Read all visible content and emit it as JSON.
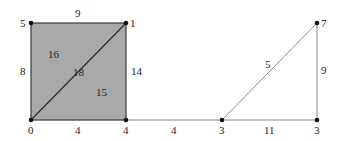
{
  "diagram": {
    "type": "weighted-graph",
    "colors": {
      "face_fill": "#a9a9a9",
      "edge": "#3a3a3a",
      "light_edge": "#8c8c8c",
      "node": "#111111"
    },
    "nodes": [
      {
        "id": "n5",
        "label": "5",
        "x": 31,
        "y": 23
      },
      {
        "id": "n1",
        "label": "1",
        "x": 126,
        "y": 23
      },
      {
        "id": "n0",
        "label": "0",
        "x": 31,
        "y": 120
      },
      {
        "id": "n4",
        "label": "4",
        "x": 126,
        "y": 120
      },
      {
        "id": "n3a",
        "label": "3",
        "x": 222,
        "y": 120
      },
      {
        "id": "n3b",
        "label": "3",
        "x": 317,
        "y": 120
      },
      {
        "id": "n7",
        "label": "7",
        "x": 317,
        "y": 23
      }
    ],
    "edges": [
      {
        "from": "n5",
        "to": "n1",
        "label": "9"
      },
      {
        "from": "n5",
        "to": "n0",
        "label": "8"
      },
      {
        "from": "n1",
        "to": "n4",
        "label": "14"
      },
      {
        "from": "n0",
        "to": "n4",
        "label": "4"
      },
      {
        "from": "n0",
        "to": "n1",
        "label": "18"
      },
      {
        "from": "n4",
        "to": "n3a",
        "label": "4"
      },
      {
        "from": "n3a",
        "to": "n3b",
        "label": "11"
      },
      {
        "from": "n3a",
        "to": "n7",
        "label": "5"
      },
      {
        "from": "n3b",
        "to": "n7",
        "label": "9"
      }
    ],
    "faces": [
      {
        "id": "upper-left-triangle",
        "label": "16"
      },
      {
        "id": "lower-right-triangle",
        "label": "15"
      }
    ]
  }
}
